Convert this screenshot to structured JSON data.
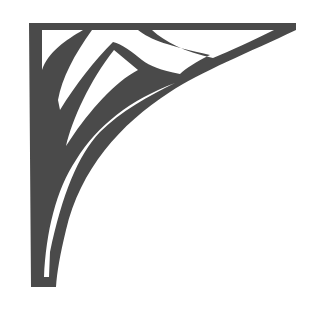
{
  "image": {
    "subject": "Decorative corner bracket ornament",
    "description": "Art-nouveau style corner bracket with a solid top bar and left post joined by a curved quarter-arc brace, with inner flowing leaf/chevron cut-outs",
    "icon": "corner-bracket-icon"
  },
  "colors": {
    "fill": "#4a4a4a",
    "background": "#ffffff"
  }
}
